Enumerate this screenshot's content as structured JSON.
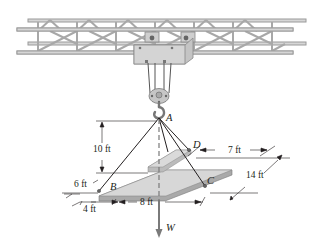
{
  "figure": {
    "points": {
      "A": "A",
      "B": "B",
      "C": "C",
      "D": "D"
    },
    "force": "W",
    "dimensions": {
      "height_A": "10 ft",
      "offset_6": "6 ft",
      "offset_4": "4 ft",
      "span_8": "8 ft",
      "span_7": "7 ft",
      "depth_14": "14 ft"
    },
    "colors": {
      "truss": "#c8c8c8",
      "truss_edge": "#8a8a8a",
      "trolley": "#d0d0d0",
      "plate_top": "#d4d4d4",
      "plate_edge": "#b0b0b0",
      "cable": "#231f20",
      "weight_arrow": "#7a7a7a"
    }
  }
}
